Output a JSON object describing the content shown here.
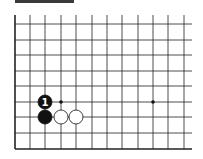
{
  "diagram": {
    "type": "go-board-fragment",
    "grid": {
      "columns_x": [
        15,
        30,
        45,
        61,
        76,
        92,
        107,
        122,
        138,
        153,
        168,
        184
      ],
      "rows_y": [
        24,
        40,
        55,
        71,
        86,
        102,
        117,
        133,
        149
      ],
      "top_y": 15,
      "right_x": 192,
      "line_color": "#222222",
      "edge_left": true,
      "edge_bottom": true
    },
    "star_points": [
      {
        "x": 61,
        "y": 102
      },
      {
        "x": 153,
        "y": 102
      }
    ],
    "stones": [
      {
        "color": "black",
        "x": 45,
        "y": 102,
        "label": "1"
      },
      {
        "color": "black",
        "x": 45,
        "y": 117,
        "label": ""
      },
      {
        "color": "white",
        "x": 61,
        "y": 117,
        "label": ""
      },
      {
        "color": "white",
        "x": 76,
        "y": 117,
        "label": ""
      }
    ],
    "header_bar_color": "#3a3a3a"
  }
}
